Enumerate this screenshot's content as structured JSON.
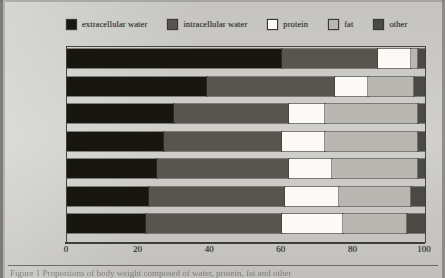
{
  "figure": {
    "caption": "Figure 1 Proportions of body weight composed of water, protein, fat and other constituents",
    "caption_visible_fragment": "Figure 1 Proportions of body weight composed of water, protein, fat and other"
  },
  "legend": {
    "position": "top",
    "items": [
      {
        "label": "extracellular water",
        "color": "#17160f",
        "swatch": "legend-swatch-extracellular-water"
      },
      {
        "label": "intracellular water",
        "color": "#57554e",
        "swatch": "legend-swatch-intracellular-water"
      },
      {
        "label": "protein",
        "color": "#fbfaf6",
        "swatch": "legend-swatch-protein"
      },
      {
        "label": "fat",
        "color": "#b9b7b1",
        "swatch": "legend-swatch-fat"
      },
      {
        "label": "other",
        "color": "#4b4944",
        "swatch": "legend-swatch-other"
      }
    ]
  },
  "axis": {
    "x_ticks": [
      "0",
      "20",
      "40",
      "60",
      "80",
      "100"
    ],
    "x_min": 0,
    "x_max": 100
  },
  "chart_data": {
    "type": "bar",
    "orientation": "horizontal",
    "stacked": true,
    "normalized_percent": true,
    "title": "",
    "xlabel": "",
    "ylabel": "",
    "xlim": [
      0,
      100
    ],
    "grid": false,
    "legend_position": "top",
    "categories": [
      "Premature",
      "Newborn",
      "4 mo",
      "12 mo",
      "24 mo",
      "36 mo",
      "Adult"
    ],
    "series": [
      {
        "name": "extracellular water",
        "color": "#17160f",
        "values": [
          60,
          39,
          30,
          27,
          25,
          23,
          22
        ]
      },
      {
        "name": "intracellular water",
        "color": "#57554e",
        "values": [
          27,
          36,
          32,
          33,
          37,
          38,
          38
        ]
      },
      {
        "name": "protein",
        "color": "#fbfaf6",
        "values": [
          9,
          9,
          10,
          12,
          12,
          15,
          17
        ]
      },
      {
        "name": "fat",
        "color": "#b9b7b1",
        "values": [
          2,
          13,
          26,
          26,
          24,
          20,
          18
        ]
      },
      {
        "name": "other",
        "color": "#4b4944",
        "values": [
          2,
          3,
          2,
          2,
          2,
          4,
          5
        ]
      }
    ]
  }
}
